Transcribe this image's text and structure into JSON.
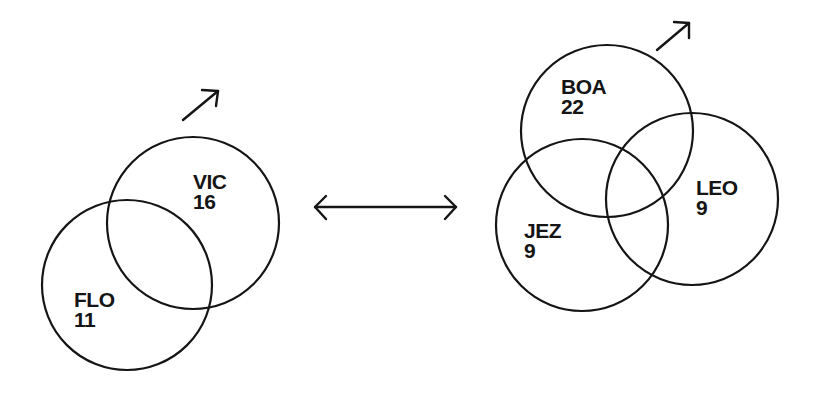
{
  "diagram": {
    "type": "venn-comparison",
    "left_group": {
      "sets": [
        {
          "id": "vic",
          "name": "VIC",
          "value": "16",
          "cx": 193,
          "cy": 223,
          "r": 86
        },
        {
          "id": "flo",
          "name": "FLO",
          "value": "11",
          "cx": 127,
          "cy": 285,
          "r": 85
        }
      ],
      "trend_arrow": {
        "direction": "up-right",
        "x1": 183,
        "y1": 120,
        "x2": 218,
        "y2": 91
      }
    },
    "connector": {
      "type": "double-headed-arrow",
      "x1": 314,
      "x2": 457,
      "y": 207
    },
    "right_group": {
      "sets": [
        {
          "id": "boa",
          "name": "BOA",
          "value": "22",
          "cx": 607,
          "cy": 131,
          "r": 86
        },
        {
          "id": "jez",
          "name": "JEZ",
          "value": "9",
          "cx": 582,
          "cy": 225,
          "r": 86
        },
        {
          "id": "leo",
          "name": "LEO",
          "value": "9",
          "cx": 692,
          "cy": 199,
          "r": 86
        }
      ],
      "trend_arrow": {
        "direction": "up-right",
        "x1": 657,
        "y1": 50,
        "x2": 689,
        "y2": 23
      }
    },
    "colors": {
      "stroke": "#151515",
      "background": "#ffffff"
    }
  }
}
